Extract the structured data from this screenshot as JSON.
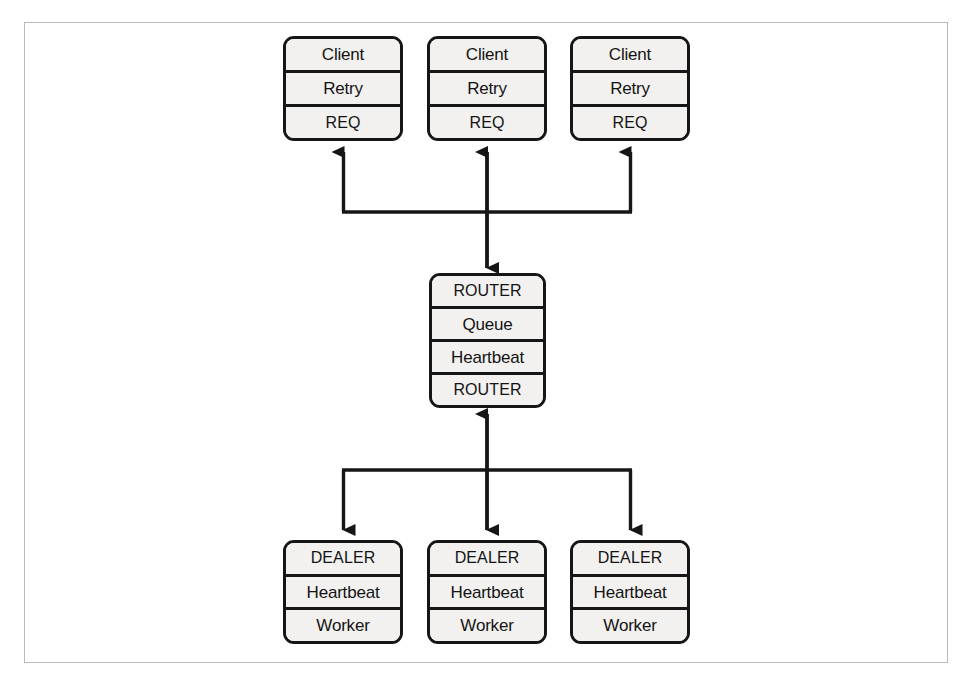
{
  "figure": {
    "background_color": "#ffffff",
    "frame_color": "#b9b9bb",
    "node_fill_color": "#f2f1ef",
    "node_stroke_color": "#161616",
    "connector_color": "#161616"
  },
  "clients": [
    {
      "id": "client-1",
      "rows": [
        "Client",
        "Retry",
        "REQ"
      ]
    },
    {
      "id": "client-2",
      "rows": [
        "Client",
        "Retry",
        "REQ"
      ]
    },
    {
      "id": "client-3",
      "rows": [
        "Client",
        "Retry",
        "REQ"
      ]
    }
  ],
  "broker": {
    "id": "broker",
    "rows": [
      "ROUTER",
      "Queue",
      "Heartbeat",
      "ROUTER"
    ]
  },
  "workers": [
    {
      "id": "worker-1",
      "rows": [
        "DEALER",
        "Heartbeat",
        "Worker"
      ]
    },
    {
      "id": "worker-2",
      "rows": [
        "DEALER",
        "Heartbeat",
        "Worker"
      ]
    },
    {
      "id": "worker-3",
      "rows": [
        "DEALER",
        "Heartbeat",
        "Worker"
      ]
    }
  ],
  "connectors": {
    "upper_bus_label": "client-bus",
    "lower_bus_label": "worker-bus",
    "arrow_style": "solid-triangle"
  }
}
